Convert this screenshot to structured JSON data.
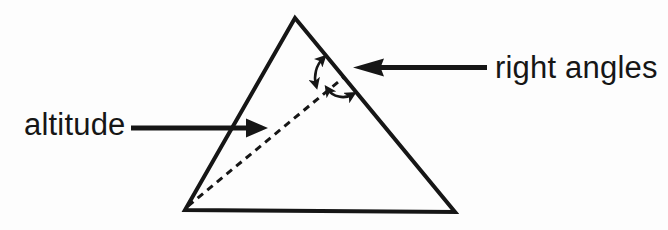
{
  "page": {
    "background": "#fdfdfd",
    "ink_color": "#161616"
  },
  "diagram": {
    "labels": {
      "altitude": "altitude",
      "right_angles": "right angles"
    },
    "shapes": {
      "triangle": "triangle-outline",
      "altitude_line": "dashed-altitude-segment",
      "angle_marks": [
        "upper-curved-double-arrow",
        "lower-curved-double-arrow"
      ],
      "leader_arrows": [
        "altitude-leader-arrow",
        "right-angles-leader-arrow"
      ]
    }
  }
}
